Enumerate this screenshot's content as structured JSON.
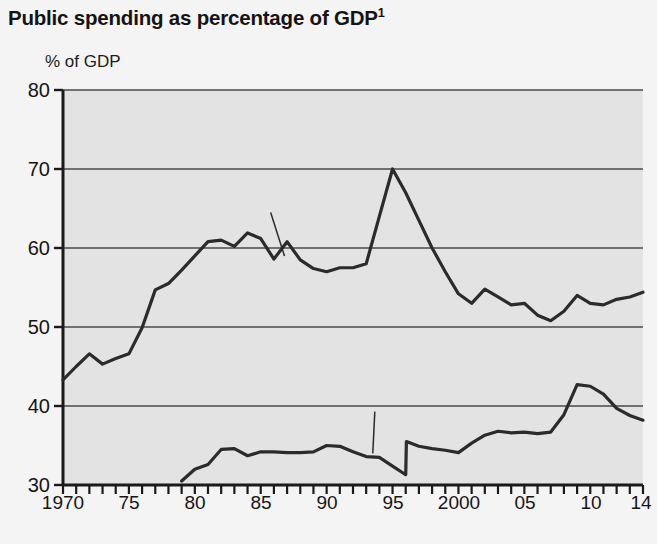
{
  "page": {
    "background_color": "#f4f4f4",
    "plot_background_color": "#e3e3e3",
    "line_color": "#2b2b2b",
    "axis_color": "#1a1a1a",
    "gridline_color": "#4a4a4a"
  },
  "title": {
    "text": "Public spending as percentage of GDP",
    "footnote_marker": "1"
  },
  "axis": {
    "y_label": "% of GDP",
    "y_ticks": [
      "30",
      "40",
      "50",
      "60",
      "70",
      "80"
    ],
    "x_ticks_labeled": [
      "1970",
      "75",
      "80",
      "85",
      "90",
      "95",
      "2000",
      "05",
      "10",
      "14"
    ]
  },
  "labels": {
    "sweden": "Sweden",
    "usa": "USA"
  },
  "chart_data": {
    "type": "line",
    "title": "Public spending as percentage of GDP",
    "xlabel": "",
    "ylabel": "% of GDP",
    "xlim": [
      1970,
      2014
    ],
    "ylim": [
      30,
      80
    ],
    "yticks": [
      30,
      40,
      50,
      60,
      70,
      80
    ],
    "xticks_labeled": [
      1970,
      1975,
      1980,
      1985,
      1990,
      1995,
      2000,
      2005,
      2010,
      2014
    ],
    "xtick_minor_every": 1,
    "grid": "horizontal",
    "legend": "inline-annotations",
    "series": [
      {
        "name": "Sweden",
        "x": [
          1970,
          1971,
          1972,
          1973,
          1974,
          1975,
          1976,
          1977,
          1978,
          1979,
          1980,
          1981,
          1982,
          1983,
          1984,
          1985,
          1986,
          1987,
          1988,
          1989,
          1990,
          1991,
          1992,
          1993,
          1994,
          1995,
          1996,
          1997,
          1998,
          1999,
          2000,
          2001,
          2002,
          2003,
          2004,
          2005,
          2006,
          2007,
          2008,
          2009,
          2010,
          2011,
          2012,
          2013,
          2014
        ],
        "values": [
          43.3,
          45.0,
          46.6,
          45.3,
          46.0,
          46.6,
          49.9,
          54.7,
          55.5,
          57.2,
          59.0,
          60.8,
          61.0,
          60.2,
          61.9,
          61.2,
          58.6,
          60.8,
          58.5,
          57.4,
          57.0,
          57.5,
          57.5,
          58.0,
          64.0,
          70.0,
          67.0,
          63.5,
          60.0,
          57.0,
          54.2,
          53.0,
          54.8,
          53.8,
          52.8,
          53.0,
          51.5,
          50.8,
          52.0,
          54.0,
          53.0,
          52.8,
          53.5,
          53.8,
          54.4
        ]
      },
      {
        "name": "USA",
        "x": [
          1979,
          1980,
          1981,
          1982,
          1983,
          1984,
          1985,
          1986,
          1987,
          1988,
          1989,
          1990,
          1991,
          1992,
          1993,
          1994,
          1995,
          1996,
          1996.05,
          1997,
          1998,
          1999,
          2000,
          2001,
          2002,
          2003,
          2004,
          2005,
          2006,
          2007,
          2008,
          2009,
          2010,
          2011,
          2012,
          2013,
          2014
        ],
        "values": [
          30.5,
          32.0,
          32.6,
          34.5,
          34.6,
          33.7,
          34.2,
          34.2,
          34.1,
          34.1,
          34.2,
          35.0,
          34.9,
          34.2,
          33.6,
          33.5,
          32.4,
          31.3,
          35.5,
          34.9,
          34.6,
          34.4,
          34.1,
          35.3,
          36.3,
          36.8,
          36.6,
          36.7,
          36.5,
          36.7,
          38.9,
          42.7,
          42.5,
          41.5,
          39.7,
          38.8,
          38.2
        ]
      }
    ],
    "annotations": [
      {
        "text": "Sweden",
        "x": 1985.3,
        "y": 65.5,
        "leader_to_x": 1986.8,
        "leader_to_y": 59.0
      },
      {
        "text": "USA",
        "x": 1993.2,
        "y": 40.3,
        "leader_to_x": 1993.5,
        "leader_to_y": 34.0
      }
    ]
  }
}
